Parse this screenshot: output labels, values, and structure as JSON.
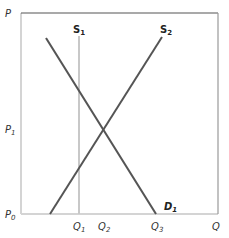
{
  "diagram": {
    "type": "supply-demand",
    "axes": {
      "y_label": "P",
      "x_label": "Q"
    },
    "price_ticks": [
      {
        "base": "P",
        "sub": "1",
        "y": 129
      },
      {
        "base": "P",
        "sub": "0",
        "y": 214
      }
    ],
    "quantity_ticks": [
      {
        "base": "Q",
        "sub": "1",
        "x": 79
      },
      {
        "base": "Q",
        "sub": "2",
        "x": 104
      },
      {
        "base": "Q",
        "sub": "3",
        "x": 157
      }
    ],
    "curves": [
      {
        "name": "S",
        "sub": "1",
        "kind": "vertical supply",
        "x1": 79,
        "y1": 36,
        "x2": 79,
        "y2": 214,
        "color": "#c8c8c8"
      },
      {
        "name": "S",
        "sub": "2",
        "kind": "upward supply",
        "x1": 50,
        "y1": 214,
        "x2": 162,
        "y2": 37,
        "color": "#555555"
      },
      {
        "name": "D",
        "sub": "1",
        "kind": "downward demand",
        "x1": 46,
        "y1": 38,
        "x2": 156,
        "y2": 214,
        "color": "#555555"
      }
    ],
    "equilibrium": {
      "x": 104,
      "y": 129
    },
    "colors": {
      "frame": "#d4d4d4",
      "top_border": "#555555",
      "right_border": "#999999",
      "line_dark": "#555555",
      "line_light": "#c8c8c8"
    }
  }
}
